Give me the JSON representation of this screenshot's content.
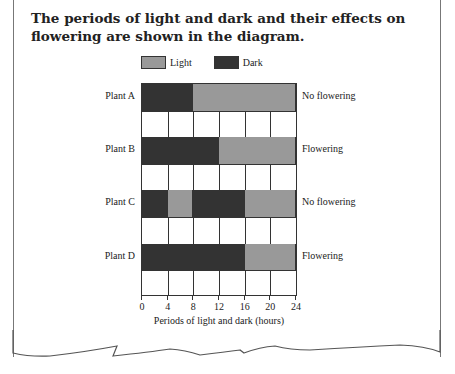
{
  "title": "The periods of light and dark and their effects on flowering are shown in the diagram.",
  "legend": [
    {
      "label": "Light",
      "color": "#999999"
    },
    {
      "label": "Dark",
      "color": "#333333"
    }
  ],
  "colors": {
    "light": "#999999",
    "dark": "#333333",
    "grid": "#333333"
  },
  "chart_data": {
    "type": "bar",
    "title": "The periods of light and dark and their effects on flowering are shown in the diagram.",
    "xlabel": "Periods of light and dark (hours)",
    "ylabel": "",
    "xlim": [
      0,
      24
    ],
    "x_ticks": [
      0,
      4,
      8,
      12,
      16,
      20,
      24
    ],
    "grid": true,
    "legend": [
      "Light",
      "Dark"
    ],
    "legend_position": "top",
    "categories": [
      "Plant A",
      "Plant B",
      "Plant C",
      "Plant D"
    ],
    "rows": [
      {
        "plant": "Plant A",
        "outcome": "No flowering",
        "segments": [
          {
            "type": "Dark",
            "start": 0,
            "end": 8
          },
          {
            "type": "Light",
            "start": 8,
            "end": 24
          }
        ]
      },
      {
        "plant": "Plant B",
        "outcome": "Flowering",
        "segments": [
          {
            "type": "Dark",
            "start": 0,
            "end": 12
          },
          {
            "type": "Light",
            "start": 12,
            "end": 24
          }
        ]
      },
      {
        "plant": "Plant C",
        "outcome": "No flowering",
        "segments": [
          {
            "type": "Dark",
            "start": 0,
            "end": 4
          },
          {
            "type": "Light",
            "start": 4,
            "end": 8
          },
          {
            "type": "Dark",
            "start": 8,
            "end": 16
          },
          {
            "type": "Light",
            "start": 16,
            "end": 24
          }
        ]
      },
      {
        "plant": "Plant D",
        "outcome": "Flowering",
        "segments": [
          {
            "type": "Dark",
            "start": 0,
            "end": 16
          },
          {
            "type": "Light",
            "start": 16,
            "end": 24
          }
        ]
      }
    ]
  }
}
